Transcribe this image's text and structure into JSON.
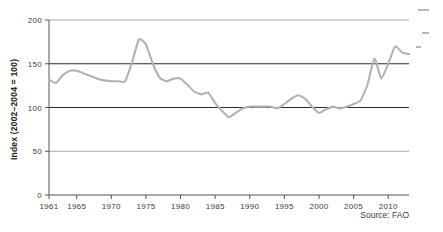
{
  "figure": {
    "source_note": "Source: FAO",
    "background": "#ffffff"
  },
  "axis": {
    "y_label": "Index (2002–2004 = 100)",
    "y_ticks": [
      "0",
      "50",
      "100",
      "150",
      "200"
    ],
    "x_ticks": [
      "1961",
      "1965",
      "1970",
      "1975",
      "1980",
      "1985",
      "1990",
      "1995",
      "2000",
      "2005",
      "2010"
    ]
  },
  "colors": {
    "line": "#b2b2b2",
    "gridline_major": "#2b2b2b",
    "gridline_minor": "#9a9a9a",
    "axis": "#555555",
    "text": "#3d3d3d"
  },
  "chart_data": {
    "type": "line",
    "title": "",
    "subtitle": "",
    "xlabel": "",
    "ylabel": "Index (2002–2004 = 100)",
    "xlim": [
      1961,
      2013
    ],
    "ylim": [
      0,
      200
    ],
    "grid": true,
    "legend": "none",
    "gridlines_y": [
      50,
      100,
      150,
      200
    ],
    "annotations": [
      "Source: FAO"
    ],
    "series": [
      {
        "name": "FAO Food Price Index (real)",
        "x": [
          1961,
          1962,
          1963,
          1964,
          1965,
          1966,
          1967,
          1968,
          1969,
          1970,
          1971,
          1972,
          1973,
          1974,
          1975,
          1976,
          1977,
          1978,
          1979,
          1980,
          1981,
          1982,
          1983,
          1984,
          1985,
          1986,
          1987,
          1988,
          1989,
          1990,
          1991,
          1992,
          1993,
          1994,
          1995,
          1996,
          1997,
          1998,
          1999,
          2000,
          2001,
          2002,
          2003,
          2004,
          2005,
          2006,
          2007,
          2008,
          2009,
          2010,
          2011,
          2012,
          2013
        ],
        "values": [
          132,
          128,
          137,
          142,
          142,
          139,
          136,
          133,
          131,
          130,
          130,
          130,
          152,
          178,
          172,
          150,
          134,
          130,
          133,
          133,
          126,
          118,
          115,
          117,
          105,
          96,
          89,
          94,
          99,
          101,
          101,
          101,
          101,
          99,
          104,
          110,
          114,
          110,
          101,
          94,
          98,
          101,
          99,
          101,
          104,
          108,
          126,
          156,
          133,
          150,
          170,
          163,
          161
        ]
      }
    ]
  }
}
